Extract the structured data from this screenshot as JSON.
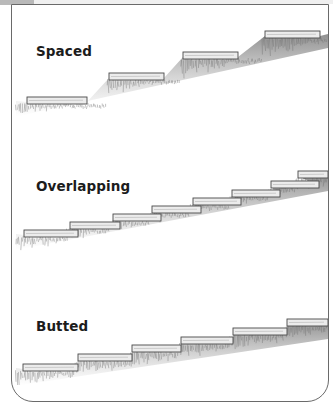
{
  "figure": {
    "panels": [
      {
        "id": "spaced",
        "label": "Spaced",
        "label_pos": {
          "x": 24,
          "y": 39
        },
        "top": 4,
        "height": 125,
        "steps": [
          {
            "x": 15,
            "y": 93,
            "w": 60
          },
          {
            "x": 97,
            "y": 69,
            "w": 55
          },
          {
            "x": 171,
            "y": 48,
            "w": 55
          },
          {
            "x": 253,
            "y": 27,
            "w": 55
          }
        ],
        "slope": {
          "x1": 4,
          "y1": 102,
          "x2": 316,
          "y2": 26
        }
      },
      {
        "id": "overlapping",
        "label": "Overlapping",
        "label_pos": {
          "x": 24,
          "y": 35
        },
        "top": 143,
        "height": 130,
        "steps": [
          {
            "x": 12,
            "y": 87,
            "w": 54
          },
          {
            "x": 58,
            "y": 79,
            "w": 50
          },
          {
            "x": 101,
            "y": 71,
            "w": 48
          },
          {
            "x": 140,
            "y": 63,
            "w": 49
          },
          {
            "x": 181,
            "y": 55,
            "w": 48
          },
          {
            "x": 220,
            "y": 47,
            "w": 48
          },
          {
            "x": 259,
            "y": 38,
            "w": 48
          },
          {
            "x": 286,
            "y": 28,
            "w": 30
          }
        ],
        "slope": {
          "x1": 4,
          "y1": 96,
          "x2": 316,
          "y2": 30
        }
      },
      {
        "id": "butted",
        "label": "Butted",
        "label_pos": {
          "x": 24,
          "y": 33
        },
        "top": 285,
        "height": 115,
        "steps": [
          {
            "x": 11,
            "y": 79,
            "w": 55
          },
          {
            "x": 66,
            "y": 69,
            "w": 54
          },
          {
            "x": 120,
            "y": 60,
            "w": 49
          },
          {
            "x": 169,
            "y": 52,
            "w": 52
          },
          {
            "x": 221,
            "y": 43,
            "w": 54
          },
          {
            "x": 275,
            "y": 34,
            "w": 41
          }
        ],
        "slope": {
          "x1": 4,
          "y1": 90,
          "x2": 316,
          "y2": 36
        }
      }
    ],
    "colors": {
      "frame": "#6a6a6a",
      "board_fill": "#ececec",
      "board_edge": "#4a4a4a",
      "grass_dark": "#7d7d7d",
      "grass_light": "#b5b5b5",
      "text": "#1c1c1c"
    }
  }
}
